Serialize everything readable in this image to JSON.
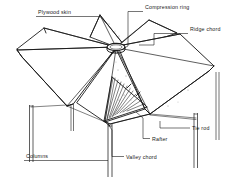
{
  "figure": {
    "style": "technical line drawing",
    "background_color": "#ffffff",
    "line_color": "#1a1a1a",
    "text_color": "#1a1a1a"
  },
  "callouts": [
    {
      "id": "plywood-skin",
      "label": "Plywood skin",
      "position": "top-left",
      "text_x": 38,
      "text_y": 14,
      "leader": "M 36 16.5 L 100 16.5 L 107 24"
    },
    {
      "id": "compression-ring",
      "label": "Compression ring",
      "position": "top-center-right",
      "text_x": 145,
      "text_y": 9,
      "leader": "M 143 11.5 L 128 11.5 L 128 46 L 124 48"
    },
    {
      "id": "ridge-chord",
      "label": "Ridge chord",
      "position": "top-right",
      "text_x": 190,
      "text_y": 31,
      "leader": "M 188 33.5 L 154 33.5 L 154 45 L 139 45"
    },
    {
      "id": "tie-rod",
      "label": "Tie rod",
      "position": "bottom-right",
      "text_x": 192,
      "text_y": 130,
      "leader": "M 190 128 L 160 128 L 160 121"
    },
    {
      "id": "rafter",
      "label": "Rafter",
      "position": "bottom-center-right",
      "text_x": 152,
      "text_y": 141,
      "leader": "M 150 138.5 L 143 138.5 L 143 118 L 136 112"
    },
    {
      "id": "valley-chord",
      "label": "Valley chord",
      "position": "bottom-center",
      "text_x": 126,
      "text_y": 159,
      "leader": "M 124 156.5 L 112 156.5 L 112 130 L 108 124"
    },
    {
      "id": "columns",
      "label": "Columns",
      "position": "bottom-left",
      "text_x": 26,
      "text_y": 158,
      "leader": "M 24 160.5 L 108 160.5"
    }
  ],
  "structure": {
    "panel_count": 6,
    "hub": {
      "cx": 116,
      "cy": 47,
      "rx": 9,
      "ry": 3.6
    },
    "columns": [
      {
        "id": "column-left",
        "x": 31,
        "top": 105,
        "bottom": 162
      },
      {
        "id": "column-center",
        "x": 110,
        "top": 124,
        "bottom": 176
      },
      {
        "id": "column-right",
        "x": 196,
        "top": 113,
        "bottom": 168
      }
    ]
  }
}
